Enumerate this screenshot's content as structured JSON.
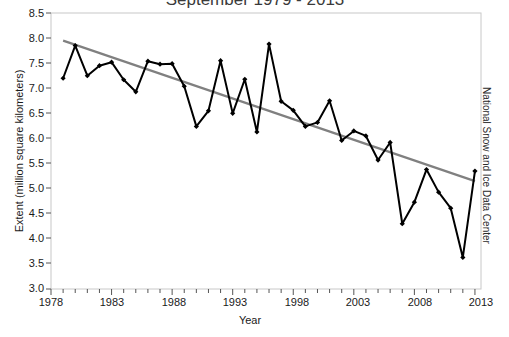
{
  "chart_data": {
    "type": "line",
    "title": "September 1979 - 2013",
    "xlabel": "Year",
    "ylabel": "Extent (million square kilometers)",
    "credit": "National Snow and Ice Data Center",
    "xlim": [
      1978,
      2013.5
    ],
    "ylim": [
      3.0,
      8.5
    ],
    "grid": false,
    "legend": null,
    "y_ticks": [
      "8.5",
      "8.0",
      "7.5",
      "7.0",
      "6.5",
      "6.0",
      "5.5",
      "5.0",
      "4.5",
      "4.0",
      "3.5",
      "3.0"
    ],
    "y_tick_values": [
      8.5,
      8.0,
      7.5,
      7.0,
      6.5,
      6.0,
      5.5,
      5.0,
      4.5,
      4.0,
      3.5,
      3.0
    ],
    "x_ticks": [
      "1978",
      "1983",
      "1988",
      "1993",
      "1998",
      "2003",
      "2008",
      "2013"
    ],
    "x_tick_values": [
      1978,
      1983,
      1988,
      1993,
      1998,
      2003,
      2008,
      2013
    ],
    "x_minor_step": 1,
    "series": [
      {
        "name": "September sea ice extent",
        "color": "#000000",
        "marker": "diamond",
        "x": [
          1979,
          1980,
          1981,
          1982,
          1983,
          1984,
          1985,
          1986,
          1987,
          1988,
          1989,
          1990,
          1991,
          1992,
          1993,
          1994,
          1995,
          1996,
          1997,
          1998,
          1999,
          2000,
          2001,
          2002,
          2003,
          2004,
          2005,
          2006,
          2007,
          2008,
          2009,
          2010,
          2011,
          2012,
          2013
        ],
        "values": [
          7.2,
          7.85,
          7.25,
          7.45,
          7.52,
          7.17,
          6.93,
          7.54,
          7.48,
          7.49,
          7.04,
          6.24,
          6.55,
          7.55,
          6.5,
          7.18,
          6.13,
          7.88,
          6.74,
          6.56,
          6.24,
          6.32,
          6.75,
          5.96,
          6.15,
          6.05,
          5.57,
          5.92,
          4.3,
          4.73,
          5.38,
          4.93,
          4.61,
          3.63,
          5.35
        ],
        "units": "million square kilometers"
      },
      {
        "name": "Linear trend",
        "color": "#808080",
        "marker": "none",
        "x": [
          1979,
          2013
        ],
        "values": [
          7.95,
          5.15
        ],
        "style": "solid"
      }
    ]
  }
}
